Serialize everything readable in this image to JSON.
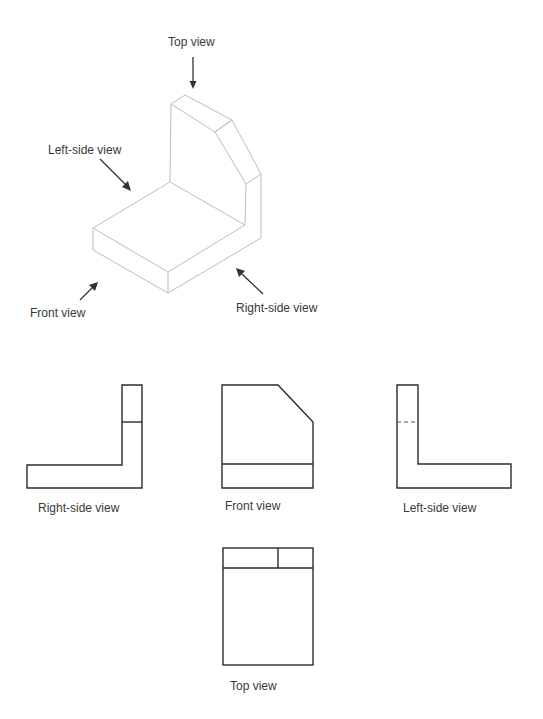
{
  "diagram": {
    "title": "",
    "type": "orthographic projection of an L-shaped block with chamfered upright",
    "isometric": {
      "labels": {
        "top_view": "Top view",
        "left_side_view": "Left-side view",
        "front_view": "Front view",
        "right_side_view": "Right-side view"
      }
    },
    "orthographic": {
      "views": [
        {
          "id": "right-side",
          "label": "Right-side view"
        },
        {
          "id": "front",
          "label": "Front view"
        },
        {
          "id": "left-side",
          "label": "Left-side view"
        },
        {
          "id": "top",
          "label": "Top view"
        }
      ]
    },
    "colors": {
      "isometric_line": "#b5b5b5",
      "ortho_line": "#2b2b2b",
      "text": "#3a3a3a",
      "background": "#ffffff"
    }
  }
}
